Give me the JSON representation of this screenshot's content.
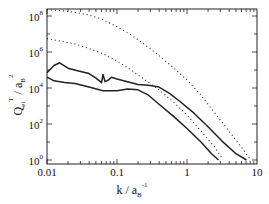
{
  "chart_data": {
    "type": "line",
    "title": "",
    "xlabel": "k / a_B^-1",
    "ylabel": "Q_ei^T / a_B^2",
    "xscale": "log",
    "yscale": "log",
    "xlim": [
      0.01,
      10
    ],
    "ylim": [
      0.5,
      300000000.0
    ],
    "grid": false,
    "legend": null,
    "x_ticks": [
      {
        "value": 0.01,
        "label": "0.01"
      },
      {
        "value": 0.1,
        "label": "0.1"
      },
      {
        "value": 1,
        "label": "1"
      },
      {
        "value": 10,
        "label": "10"
      }
    ],
    "y_ticks": [
      {
        "exp": 0,
        "base": "10",
        "sup": "0"
      },
      {
        "exp": 2,
        "base": "10",
        "sup": "2"
      },
      {
        "exp": 4,
        "base": "10",
        "sup": "4"
      },
      {
        "exp": 6,
        "base": "10",
        "sup": "6"
      },
      {
        "exp": 8,
        "base": "10",
        "sup": "8"
      }
    ],
    "series": [
      {
        "name": "dotted-upper",
        "style": "dotted",
        "points_log10": [
          [
            -2,
            8.35
          ],
          [
            -1.8,
            8.3
          ],
          [
            -1.6,
            8.2
          ],
          [
            -1.4,
            8.05
          ],
          [
            -1.2,
            7.8
          ],
          [
            -1.0,
            7.4
          ],
          [
            -0.8,
            6.95
          ],
          [
            -0.6,
            6.4
          ],
          [
            -0.4,
            5.8
          ],
          [
            -0.2,
            5.15
          ],
          [
            0,
            4.45
          ],
          [
            0.2,
            3.6
          ],
          [
            0.4,
            2.6
          ],
          [
            0.6,
            1.6
          ],
          [
            0.8,
            0.6
          ],
          [
            0.9,
            0.05
          ]
        ]
      },
      {
        "name": "dotted-lower",
        "style": "dotted",
        "points_log10": [
          [
            -2,
            6.75
          ],
          [
            -1.8,
            6.6
          ],
          [
            -1.6,
            6.45
          ],
          [
            -1.4,
            6.2
          ],
          [
            -1.2,
            5.9
          ],
          [
            -1.0,
            5.5
          ],
          [
            -0.8,
            5.0
          ],
          [
            -0.6,
            4.45
          ],
          [
            -0.4,
            3.9
          ],
          [
            -0.2,
            3.25
          ],
          [
            0,
            2.5
          ],
          [
            0.2,
            1.6
          ],
          [
            0.4,
            0.7
          ],
          [
            0.5,
            0.1
          ]
        ]
      },
      {
        "name": "solid-upper",
        "style": "solid",
        "points_log10": [
          [
            -2,
            4.85
          ],
          [
            -1.9,
            5.25
          ],
          [
            -1.82,
            5.4
          ],
          [
            -1.7,
            5.1
          ],
          [
            -1.55,
            4.95
          ],
          [
            -1.4,
            4.8
          ],
          [
            -1.3,
            4.55
          ],
          [
            -1.22,
            4.3
          ],
          [
            -1.2,
            4.75
          ],
          [
            -1.17,
            4.35
          ],
          [
            -1.12,
            4.45
          ],
          [
            -1.08,
            4.6
          ],
          [
            -1.0,
            4.5
          ],
          [
            -0.85,
            4.35
          ],
          [
            -0.7,
            4.2
          ],
          [
            -0.55,
            4.15
          ],
          [
            -0.4,
            4.05
          ],
          [
            -0.25,
            3.7
          ],
          [
            -0.1,
            3.25
          ],
          [
            0.1,
            2.6
          ],
          [
            0.3,
            1.85
          ],
          [
            0.5,
            1.05
          ],
          [
            0.7,
            0.35
          ],
          [
            0.85,
            0.0
          ]
        ]
      },
      {
        "name": "solid-lower",
        "style": "solid",
        "points_log10": [
          [
            -2,
            4.6
          ],
          [
            -1.9,
            4.4
          ],
          [
            -1.75,
            4.3
          ],
          [
            -1.6,
            4.25
          ],
          [
            -1.4,
            4.05
          ],
          [
            -1.2,
            3.85
          ],
          [
            -1.0,
            3.85
          ],
          [
            -0.85,
            3.95
          ],
          [
            -0.7,
            3.9
          ],
          [
            -0.55,
            3.6
          ],
          [
            -0.4,
            3.1
          ],
          [
            -0.2,
            2.45
          ],
          [
            0,
            1.75
          ],
          [
            0.2,
            1.0
          ],
          [
            0.35,
            0.35
          ],
          [
            0.45,
            0.0
          ]
        ]
      }
    ]
  },
  "axes": {
    "xlabel_main": "k  /  a",
    "xlabel_sub": "B",
    "xlabel_sup": "-1",
    "ylabel_main": "Q",
    "ylabel_sub": "ei",
    "ylabel_sup": "T",
    "ylabel_mid": "  /  a",
    "ylabel_sub2": "B",
    "ylabel_sup2": "2"
  }
}
